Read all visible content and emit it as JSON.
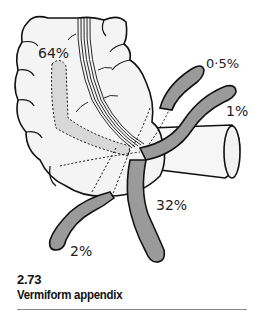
{
  "figure": {
    "number": "2.73",
    "title": "Vermiform appendix",
    "labels": {
      "retrocecal": "64%",
      "preileal": "0·5%",
      "postileal": "1%",
      "pelvic": "32%",
      "subcecal": "2%"
    },
    "colors": {
      "outline": "#111111",
      "appendix_fill": "#9a9a9a",
      "cecum_fill": "#f4f4f4",
      "ghost_fill": "#d8d8d8"
    }
  }
}
